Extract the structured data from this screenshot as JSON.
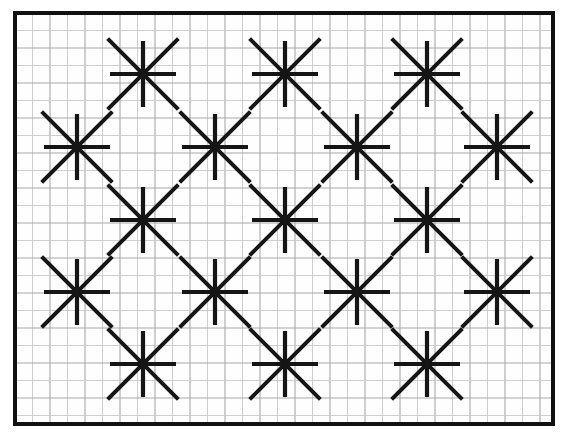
{
  "figure": {
    "canvas": {
      "width": 571,
      "height": 443,
      "background": "#ffffff"
    },
    "plate": {
      "x": 15,
      "y": 13,
      "width": 538,
      "height": 411,
      "border_color": "#111111",
      "border_width": 4,
      "fill": "#fefefe"
    },
    "grid": {
      "visible": true,
      "cell_size": 17.5,
      "minor_color": "#c9c9c9",
      "minor_width": 0.9,
      "accent_color": "#a8a8a8",
      "accent_every": 2,
      "accent_width": 1.1
    },
    "stroke": {
      "color": "#151515",
      "arm_width": 4.2,
      "diagonal_width": 4.0,
      "linecap": "butt"
    },
    "star": {
      "points": 8,
      "orthogonal_arm_length": 33,
      "diagonal_arm_length": 50,
      "ray_angles_deg": [
        0,
        45,
        90,
        135,
        180,
        225,
        270,
        315
      ]
    },
    "lattice": {
      "description": "Alternating rows of 3 and 4 stars forming a diagonal diamond net",
      "row_spacing": 72.5,
      "column_spacing": 141,
      "rows": [
        {
          "index": 1,
          "y": 74,
          "centers_x": [
            143,
            285,
            427
          ]
        },
        {
          "index": 2,
          "y": 147,
          "centers_x": [
            77,
            215,
            357,
            497
          ]
        },
        {
          "index": 3,
          "y": 220,
          "centers_x": [
            143,
            285,
            427
          ]
        },
        {
          "index": 4,
          "y": 292,
          "centers_x": [
            77,
            215,
            357,
            497
          ]
        },
        {
          "index": 5,
          "y": 364,
          "centers_x": [
            143,
            285,
            427
          ]
        }
      ]
    }
  },
  "chart_data": {
    "type": "scatter",
    "xlabel": "",
    "ylabel": "",
    "xlim": [
      15,
      553
    ],
    "ylim": [
      13,
      424
    ],
    "grid": true,
    "legend": null,
    "marker": "8-pointed-star",
    "series": [
      {
        "name": "star-centers",
        "points": [
          {
            "x": 143,
            "y": 74
          },
          {
            "x": 285,
            "y": 74
          },
          {
            "x": 427,
            "y": 74
          },
          {
            "x": 77,
            "y": 147
          },
          {
            "x": 215,
            "y": 147
          },
          {
            "x": 357,
            "y": 147
          },
          {
            "x": 497,
            "y": 147
          },
          {
            "x": 143,
            "y": 220
          },
          {
            "x": 285,
            "y": 220
          },
          {
            "x": 427,
            "y": 220
          },
          {
            "x": 77,
            "y": 292
          },
          {
            "x": 215,
            "y": 292
          },
          {
            "x": 357,
            "y": 292
          },
          {
            "x": 497,
            "y": 292
          },
          {
            "x": 143,
            "y": 364
          },
          {
            "x": 285,
            "y": 364
          },
          {
            "x": 427,
            "y": 364
          }
        ]
      }
    ],
    "counts": {
      "total_stars": 17,
      "rows": 5,
      "rays_per_star": 8
    }
  }
}
